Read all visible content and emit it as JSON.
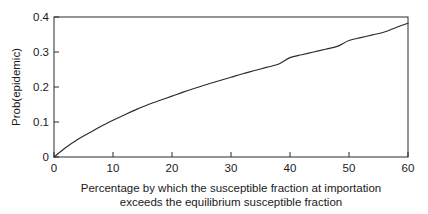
{
  "chart_data": {
    "type": "line",
    "title": "",
    "xlabel": "Percentage by which the susceptible fraction at importation exceeds the equilibrium susceptible fraction",
    "xlabel_lines": [
      "Percentage by which the susceptible fraction at importation",
      "exceeds the equilibrium susceptible fraction"
    ],
    "ylabel": "Prob(epidemic)",
    "xlim": [
      0,
      60
    ],
    "ylim": [
      0,
      0.4
    ],
    "xticks": [
      0,
      10,
      20,
      30,
      40,
      50,
      60
    ],
    "xtick_labels": [
      "0",
      "10",
      "20",
      "30",
      "40",
      "50",
      "60"
    ],
    "yticks": [
      0,
      0.1,
      0.2,
      0.3,
      0.4
    ],
    "ytick_labels": [
      "0",
      "0.1",
      "0.2",
      "0.3",
      "0.4"
    ],
    "grid": false,
    "legend": false,
    "series": [
      {
        "name": "Prob(epidemic)",
        "color": "#2b2b2b",
        "x": [
          0,
          2,
          4,
          6,
          8,
          10,
          12,
          14,
          16,
          18,
          20,
          22,
          24,
          26,
          28,
          30,
          32,
          34,
          36,
          38,
          40,
          42,
          44,
          46,
          48,
          50,
          52,
          54,
          56,
          58,
          60
        ],
        "values": [
          0.0,
          0.027,
          0.05,
          0.069,
          0.088,
          0.105,
          0.121,
          0.136,
          0.15,
          0.162,
          0.174,
          0.186,
          0.197,
          0.208,
          0.218,
          0.228,
          0.238,
          0.247,
          0.256,
          0.265,
          0.284,
          0.292,
          0.3,
          0.308,
          0.316,
          0.333,
          0.341,
          0.349,
          0.357,
          0.37,
          0.382
        ]
      }
    ]
  },
  "figure": {
    "background_color": "#ffffff",
    "axis_color": "#2b2b2b"
  }
}
